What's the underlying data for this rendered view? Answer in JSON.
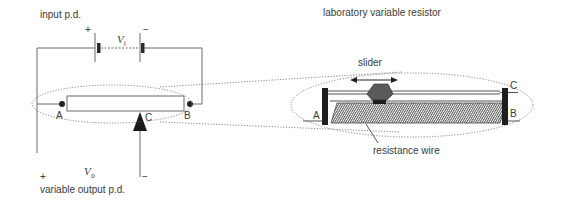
{
  "diagram": {
    "left": {
      "title": "input p.d.",
      "input_symbol": "V",
      "input_subscript": "i",
      "battery_plus": "+",
      "battery_minus": "−",
      "terminal_a": "A",
      "terminal_b": "B",
      "terminal_c": "C",
      "output_symbol": "V",
      "output_subscript": "o",
      "output_plus": "+",
      "output_minus": "−",
      "output_label": "variable output p.d."
    },
    "right": {
      "title": "laboratory variable resistor",
      "slider_label": "slider",
      "terminal_a": "A",
      "terminal_b": "B",
      "terminal_c": "C",
      "wire_label": "resistance wire"
    },
    "colors": {
      "line": "#6a6a6a",
      "dark": "#1e1e1e",
      "slider": "#555555",
      "text": "#3a3a3a"
    }
  }
}
